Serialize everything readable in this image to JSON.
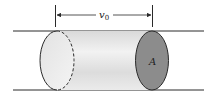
{
  "diagram": {
    "title": "",
    "velocity_label": "v",
    "velocity_subscript": "0",
    "area_label": "A",
    "colors": {
      "line": "#2a2a2a",
      "cylinder_body": "#e4e4e4",
      "end_face": "#8c8c8c",
      "left_face": "#ececec"
    },
    "elements": [
      {
        "type": "pipe-wall",
        "position": "top"
      },
      {
        "type": "pipe-wall",
        "position": "bottom"
      },
      {
        "type": "cylinder",
        "description": "fluid element moving with velocity v0"
      },
      {
        "type": "dimension-arrow",
        "label": "v0"
      },
      {
        "type": "face",
        "label": "A"
      }
    ]
  }
}
